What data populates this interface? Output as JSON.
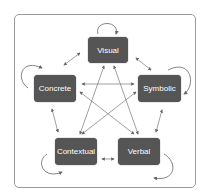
{
  "diagram": {
    "nodes": [
      {
        "id": "visual",
        "label": "Visual"
      },
      {
        "id": "concrete",
        "label": "Concrete"
      },
      {
        "id": "symbolic",
        "label": "Symbolic"
      },
      {
        "id": "contextual",
        "label": "Contextual"
      },
      {
        "id": "verbal",
        "label": "Verbal"
      }
    ],
    "edges": [
      [
        "visual",
        "concrete"
      ],
      [
        "visual",
        "symbolic"
      ],
      [
        "concrete",
        "contextual"
      ],
      [
        "symbolic",
        "verbal"
      ],
      [
        "contextual",
        "verbal"
      ],
      [
        "concrete",
        "symbolic"
      ],
      [
        "visual",
        "contextual"
      ],
      [
        "visual",
        "verbal"
      ],
      [
        "concrete",
        "verbal"
      ],
      [
        "symbolic",
        "contextual"
      ]
    ],
    "self_loops": [
      "visual",
      "concrete",
      "symbolic",
      "contextual",
      "verbal"
    ],
    "colors": {
      "node_fill": "#555555",
      "node_text": "#ffffff",
      "arrow": "#666666",
      "frame": "#9a9a9a"
    }
  }
}
